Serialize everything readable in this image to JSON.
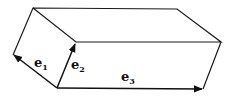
{
  "diagram": {
    "type": "parallelepiped",
    "vectors": [
      {
        "name": "e",
        "sub": "1"
      },
      {
        "name": "e",
        "sub": "2"
      },
      {
        "name": "e",
        "sub": "3"
      }
    ]
  }
}
